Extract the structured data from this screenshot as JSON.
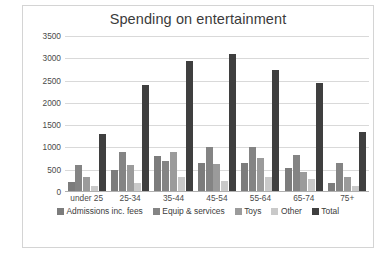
{
  "chart_data": {
    "type": "bar",
    "title": "Spending on entertainment",
    "xlabel": "",
    "ylabel": "",
    "ylim": [
      0,
      3500
    ],
    "ytick_step": 500,
    "yticks": [
      "3500",
      "3000",
      "2500",
      "2000",
      "1500",
      "1000",
      "500",
      "0"
    ],
    "grid": true,
    "legend_position": "bottom",
    "categories": [
      "under 25",
      "25-34",
      "35-44",
      "45-54",
      "55-64",
      "65-74",
      "75+"
    ],
    "series": [
      {
        "name": "Admissions inc. fees",
        "color": "#7c7c7c",
        "values": [
          230,
          490,
          800,
          660,
          640,
          540,
          200
        ]
      },
      {
        "name": "Equip & services",
        "color": "#848484",
        "values": [
          600,
          900,
          700,
          1010,
          1000,
          840,
          660
        ]
      },
      {
        "name": "Toys",
        "color": "#9b9b9b",
        "values": [
          330,
          610,
          900,
          620,
          760,
          440,
          330
        ]
      },
      {
        "name": "Other",
        "color": "#c9c9c9",
        "values": [
          130,
          200,
          330,
          240,
          330,
          300,
          130
        ]
      },
      {
        "name": "Total",
        "color": "#3f3f3f",
        "values": [
          1310,
          2400,
          2930,
          3100,
          2730,
          2450,
          1340
        ]
      }
    ]
  }
}
